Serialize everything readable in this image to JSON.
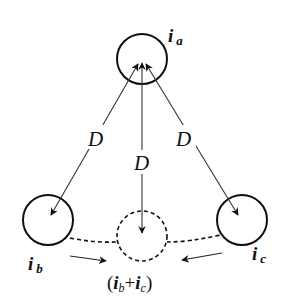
{
  "diagram": {
    "type": "current-flow-diagram",
    "nodes": [
      {
        "id": "a",
        "label_main": "i",
        "label_sub": "a",
        "style": "solid",
        "cx": 142,
        "cy": 59,
        "r": 25
      },
      {
        "id": "b",
        "label_main": "i",
        "label_sub": "b",
        "style": "solid",
        "cx": 48,
        "cy": 220,
        "r": 25
      },
      {
        "id": "c",
        "label_main": "i",
        "label_sub": "c",
        "style": "solid",
        "cx": 242,
        "cy": 220,
        "r": 25
      },
      {
        "id": "bc",
        "label": "(i_b+i_c)",
        "style": "dashed",
        "cx": 142,
        "cy": 236,
        "r": 25
      }
    ],
    "edges": [
      {
        "from": "a",
        "to": "b",
        "label": "D",
        "bidirectional": true
      },
      {
        "from": "a",
        "to": "bc",
        "label": "D",
        "bidirectional": true
      },
      {
        "from": "a",
        "to": "c",
        "label": "D",
        "bidirectional": true
      },
      {
        "from": "b",
        "to": "bc",
        "style": "dashed",
        "flow_arrow": "right"
      },
      {
        "from": "c",
        "to": "bc",
        "style": "dashed",
        "flow_arrow": "left"
      }
    ],
    "labels": {
      "ia_main": "i",
      "ia_sub": "a",
      "ib_main": "i",
      "ib_sub": "b",
      "ic_main": "i",
      "ic_sub": "c",
      "d_left": "D",
      "d_center": "D",
      "d_right": "D",
      "sum_open": "(",
      "sum_i1": "i",
      "sum_sub1": "b",
      "sum_plus": "+",
      "sum_i2": "i",
      "sum_sub2": "c",
      "sum_close": ")"
    },
    "colors": {
      "stroke": "#111111",
      "background": "#ffffff"
    }
  }
}
